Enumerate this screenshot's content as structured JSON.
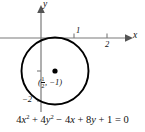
{
  "figure": {
    "type": "coordinate-plane-with-circle",
    "equation": {
      "full_text": "4x² + 4y² − 4x + 8y + 1 = 0",
      "term1_coefficient": "4",
      "term1_variable": "x",
      "term1_exponent": "2",
      "op1": "+",
      "term2_coefficient": "4",
      "term2_variable": "y",
      "term2_exponent": "2",
      "op2": "−",
      "term3_coefficient": "4",
      "term3_variable": "x",
      "op3": "+",
      "term4_coefficient": "8",
      "term4_variable": "y",
      "op4": "+",
      "term5_constant": "1",
      "equals": "=",
      "right_side": "0"
    },
    "axes": {
      "x_label": "x",
      "y_label": "y",
      "x_ticks": [
        {
          "label": "1",
          "value": 1
        },
        {
          "label": "2",
          "value": 2
        }
      ],
      "y_ticks": [
        {
          "label": "−2",
          "value": -2
        }
      ]
    },
    "circle": {
      "center_label_open": "(",
      "center_label_fraction_numerator": "1",
      "center_label_fraction_denominator": "2",
      "center_label_separator": ",",
      "center_label_y": "−1",
      "center_label_close": ")",
      "center_x": 0.5,
      "center_y": -1,
      "radius": 1
    },
    "colors": {
      "curve": "#000000",
      "axis": "#777777",
      "text": "#111111",
      "background": "#ffffff"
    }
  }
}
